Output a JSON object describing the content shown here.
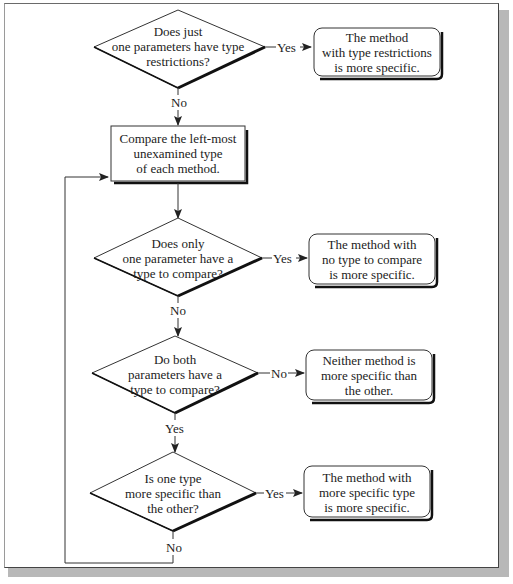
{
  "diagram": {
    "type": "flowchart",
    "decisions": [
      {
        "id": "d1",
        "text_lines": [
          "Does just",
          "one parameters have type",
          "restrictions?"
        ]
      },
      {
        "id": "d2",
        "text_lines": [
          "Does only",
          "one parameter have a",
          "type to compare?"
        ]
      },
      {
        "id": "d3",
        "text_lines": [
          "Do both",
          "parameters have a",
          "type to compare?"
        ]
      },
      {
        "id": "d4",
        "text_lines": [
          "Is one type",
          "more specific than",
          "the other?"
        ]
      }
    ],
    "process": {
      "id": "p1",
      "text_lines": [
        "Compare the left-most",
        "unexamined type",
        "of each method."
      ]
    },
    "outcomes": [
      {
        "id": "o1",
        "text_lines": [
          "The method",
          "with type restrictions",
          "is more specific."
        ]
      },
      {
        "id": "o2",
        "text_lines": [
          "The method with",
          "no type to compare",
          "is more specific."
        ]
      },
      {
        "id": "o3",
        "text_lines": [
          "Neither method is",
          "more specific than",
          "the other."
        ]
      },
      {
        "id": "o4",
        "text_lines": [
          "The method with",
          "more specific type",
          "is more specific."
        ]
      }
    ],
    "edge_labels": {
      "d1_yes": "Yes",
      "d1_no": "No",
      "d2_yes": "Yes",
      "d2_no": "No",
      "d3_no": "No",
      "d3_yes": "Yes",
      "d4_yes": "Yes",
      "d4_no": "No"
    }
  }
}
